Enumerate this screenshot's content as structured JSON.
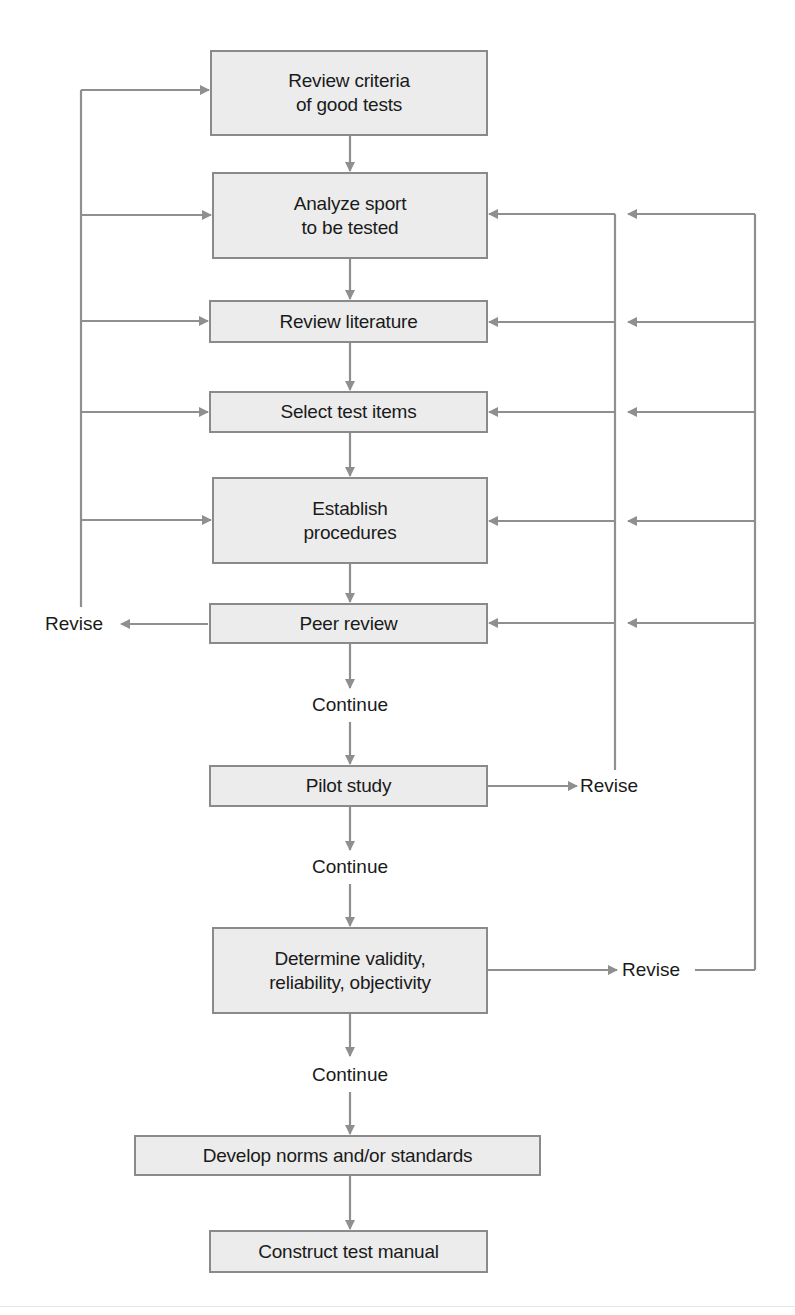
{
  "diagram": {
    "type": "flowchart",
    "colors": {
      "box_fill": "#ececec",
      "box_border": "#8a8a8a",
      "connector": "#8f8f8f",
      "text": "#1a1a1a"
    },
    "steps": [
      {
        "id": "review-criteria",
        "label": "Review criteria\nof good tests"
      },
      {
        "id": "analyze-sport",
        "label": "Analyze sport\nto be tested"
      },
      {
        "id": "review-literature",
        "label": "Review literature"
      },
      {
        "id": "select-test-items",
        "label": "Select test items"
      },
      {
        "id": "establish-procedures",
        "label": "Establish\nprocedures"
      },
      {
        "id": "peer-review",
        "label": "Peer review"
      },
      {
        "id": "pilot-study",
        "label": "Pilot study"
      },
      {
        "id": "determine-validity",
        "label": "Determine validity,\nreliability, objectivity"
      },
      {
        "id": "develop-norms",
        "label": "Develop norms and/or standards"
      },
      {
        "id": "construct-manual",
        "label": "Construct test manual"
      }
    ],
    "decisions": {
      "continue_1": "Continue",
      "continue_2": "Continue",
      "continue_3": "Continue",
      "revise_peer": "Revise",
      "revise_pilot": "Revise",
      "revise_determine": "Revise"
    },
    "feedback_loops": [
      {
        "from": "peer-review",
        "via": "Revise",
        "to": [
          "review-criteria",
          "analyze-sport",
          "review-literature",
          "select-test-items",
          "establish-procedures"
        ]
      },
      {
        "from": "pilot-study",
        "via": "Revise",
        "to": [
          "analyze-sport",
          "review-literature",
          "select-test-items",
          "establish-procedures",
          "peer-review"
        ]
      },
      {
        "from": "determine-validity",
        "via": "Revise",
        "to": [
          "analyze-sport",
          "review-literature",
          "select-test-items",
          "establish-procedures",
          "peer-review"
        ]
      }
    ]
  }
}
